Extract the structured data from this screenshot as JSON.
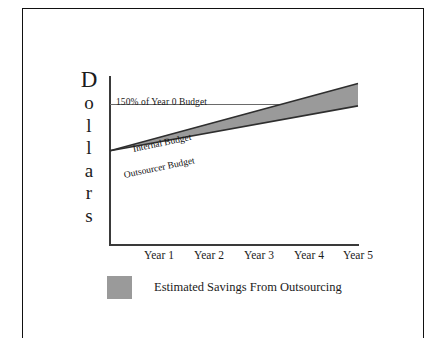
{
  "chart_data": {
    "type": "area",
    "title": "",
    "subtitle": "",
    "xlabel": "",
    "ylabel": "Dollars",
    "ylabel_letters": [
      "D",
      "o",
      "l",
      "l",
      "a",
      "r",
      "s"
    ],
    "categories": [
      "Year 1",
      "Year 2",
      "Year 3",
      "Year 4",
      "Year 5"
    ],
    "x": [
      1,
      2,
      3,
      4,
      5
    ],
    "series": [
      {
        "name": "Internal Budget",
        "values": [
          100,
          118,
          136,
          154,
          172
        ],
        "label": "Internal Budget",
        "style": "line"
      },
      {
        "name": "Outsourcer Budget",
        "values": [
          100,
          112,
          124,
          136,
          148
        ],
        "label": "Outsourcer Budget",
        "style": "line"
      }
    ],
    "fill_between": {
      "label": "Estimated Savings From Outsourcing",
      "upper_series": "Internal Budget",
      "lower_series": "Outsourcer Budget",
      "color": "#9a9a9a"
    },
    "reference_lines": [
      {
        "label": "150% of Year 0 Budget",
        "value": 150,
        "orientation": "horizontal",
        "color": "#6a6a6a"
      }
    ],
    "legend": [
      {
        "label": "Estimated Savings From Outsourcing",
        "color": "#9a9a9a",
        "marker": "square"
      }
    ],
    "legend_position": "bottom-left",
    "grid": false,
    "ylim": [
      0,
      180
    ],
    "xlim": [
      0,
      5
    ],
    "yticks": [],
    "axis_color": "#3a3a3a"
  },
  "axis": {
    "y_title_letters": [
      "D",
      "o",
      "l",
      "l",
      "a",
      "r",
      "s"
    ]
  },
  "reference": {
    "label": "150% of Year 0 Budget"
  },
  "series_labels": {
    "internal": "Internal Budget",
    "outsourcer": "Outsourcer Budget"
  },
  "xaxis": {
    "ticks": [
      "Year 1",
      "Year 2",
      "Year 3",
      "Year 4",
      "Year 5"
    ]
  },
  "legend": {
    "savings_label": "Estimated Savings From Outsourcing",
    "swatch_color": "#9a9a9a"
  }
}
